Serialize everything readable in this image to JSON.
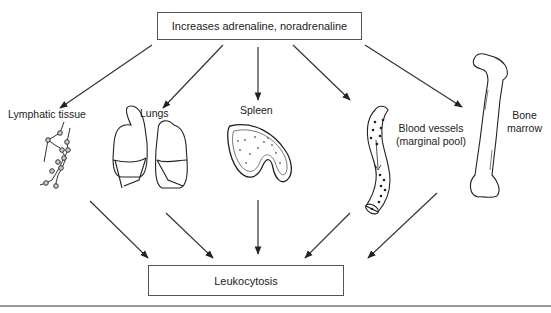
{
  "diagram": {
    "source": {
      "label": "Increases adrenaline, noradrenaline"
    },
    "target": {
      "label": "Leukocytosis"
    },
    "organs": [
      {
        "id": "lymphatic",
        "label": "Lymphatic tissue"
      },
      {
        "id": "lungs",
        "label": "Lungs"
      },
      {
        "id": "spleen",
        "label": "Spleen"
      },
      {
        "id": "blood-vessels",
        "label_line1": "Blood vessels",
        "label_line2": "(marginal pool)"
      },
      {
        "id": "bone-marrow",
        "label_line1": "Bone",
        "label_line2": "marrow"
      }
    ],
    "edges": [
      {
        "from": "source",
        "to": "lymphatic"
      },
      {
        "from": "source",
        "to": "lungs"
      },
      {
        "from": "source",
        "to": "spleen"
      },
      {
        "from": "source",
        "to": "blood-vessels"
      },
      {
        "from": "source",
        "to": "bone-marrow"
      },
      {
        "from": "lymphatic",
        "to": "target"
      },
      {
        "from": "lungs",
        "to": "target"
      },
      {
        "from": "spleen",
        "to": "target"
      },
      {
        "from": "blood-vessels",
        "to": "target"
      },
      {
        "from": "bone-marrow",
        "to": "target"
      }
    ]
  }
}
